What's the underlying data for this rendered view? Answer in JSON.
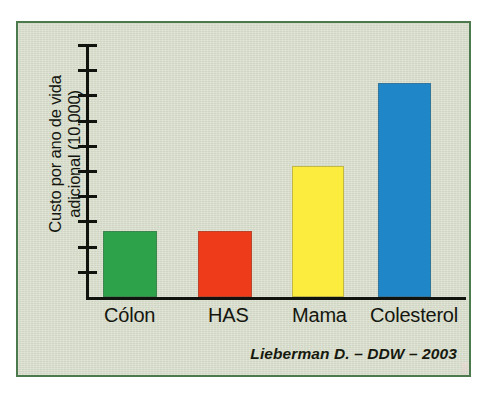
{
  "figure": {
    "panel_border_color": "#4d7a4d",
    "background_color": "#d6dcc9",
    "axis_color": "#11130f"
  },
  "chart_data": {
    "type": "bar",
    "title": "",
    "subtitle": "",
    "xlabel": "",
    "ylabel": "Custo por ano de vida\nadicional (10.000)",
    "categories": [
      "Cólon",
      "HAS",
      "Mama",
      "Colesterol"
    ],
    "values": [
      2.6,
      2.6,
      5.2,
      8.5
    ],
    "ylim": [
      0,
      10
    ],
    "yticks": [
      1,
      2,
      3,
      4,
      5,
      6,
      7,
      8,
      9,
      10
    ],
    "ytick_labels": [
      "",
      "",
      "",
      "",
      "",
      "",
      "",
      "",
      "",
      ""
    ],
    "grid": false,
    "legend": false,
    "bar_colors": [
      "#2da24a",
      "#ee3b1a",
      "#fbec3e",
      "#1f86c8"
    ],
    "series": [
      {
        "name": "Custo por ano de vida adicional (10.000)",
        "values": [
          2.6,
          2.6,
          5.2,
          8.5
        ]
      }
    ],
    "annotations": [
      {
        "name": "source-credit",
        "text": "Lieberman D. – DDW – 2003"
      }
    ]
  },
  "credit": {
    "text": "Lieberman D. – DDW – 2003"
  },
  "axis": {
    "y_label_line1": "Custo por ano de vida",
    "y_label_line2": "adicional (10.000)"
  }
}
